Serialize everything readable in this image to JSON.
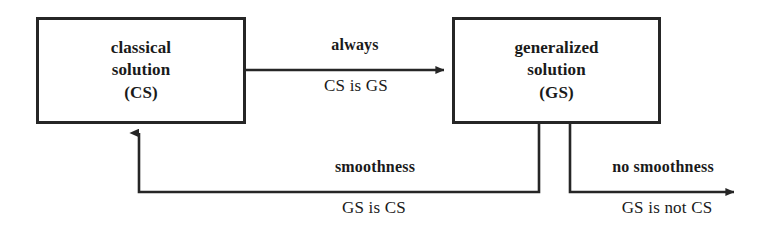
{
  "diagram": {
    "type": "flow-diagram",
    "background_color": "#ffffff",
    "stroke_color": "#262626",
    "nodes": [
      {
        "id": "classical",
        "lines": [
          "classical",
          "solution",
          "(CS)"
        ],
        "line1": "classical",
        "line2": "solution",
        "line3": "(CS)"
      },
      {
        "id": "generalized",
        "lines": [
          "generalized",
          "solution",
          "(GS)"
        ],
        "line1": "generalized",
        "line2": "solution",
        "line3": "(GS)"
      }
    ],
    "edges": [
      {
        "id": "cs-to-gs",
        "from": "classical",
        "to": "generalized",
        "condition": "always",
        "statement": "CS is GS"
      },
      {
        "id": "gs-to-cs",
        "from": "generalized",
        "to": "classical",
        "condition": "smoothness",
        "statement": "GS is CS"
      },
      {
        "id": "gs-not-cs",
        "from": "generalized",
        "to": null,
        "condition": "no smoothness",
        "statement": "GS is not CS"
      }
    ]
  }
}
